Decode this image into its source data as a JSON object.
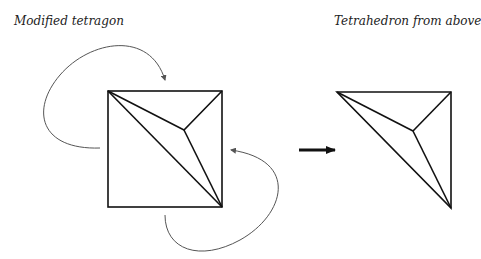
{
  "labels": {
    "left": "Modified tetragon",
    "right": "Tetrahedron from above"
  },
  "diagram": {
    "left_figure": {
      "name": "modified tetragon",
      "square": {
        "x1": 108,
        "y1": 91,
        "x2": 222,
        "y2": 207
      },
      "inner_point": [
        184,
        130
      ],
      "edges": [
        [
          [
            108,
            91
          ],
          [
            222,
            207
          ]
        ],
        [
          [
            108,
            91
          ],
          [
            184,
            130
          ]
        ],
        [
          [
            222,
            91
          ],
          [
            184,
            130
          ]
        ],
        [
          [
            184,
            130
          ],
          [
            222,
            207
          ]
        ]
      ]
    },
    "right_figure": {
      "name": "tetrahedron from above",
      "vertices": {
        "a": [
          337,
          92
        ],
        "b": [
          451,
          92
        ],
        "c": [
          451,
          208
        ],
        "apex": [
          413,
          131
        ]
      }
    },
    "transform_arrow": {
      "from": [
        300,
        150
      ],
      "to": [
        336,
        150
      ]
    },
    "colors": {
      "stroke": "#111111",
      "curve": "#555555"
    }
  }
}
